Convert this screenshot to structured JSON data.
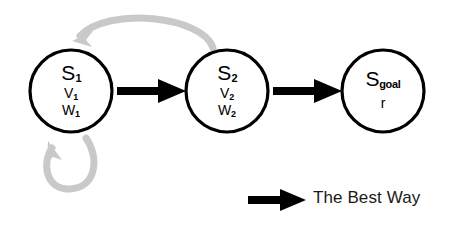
{
  "diagram": {
    "title_visible": false,
    "background_color": "#ffffff",
    "node_stroke_color": "#000000",
    "best_way_color": "#000000",
    "alternate_path_color": "#c9c9c9",
    "nodes": [
      {
        "id": "s1",
        "symbol": "S",
        "symbol_subscript": "1",
        "lines": [
          {
            "text": "V",
            "subscript": "1"
          },
          {
            "text": "W",
            "subscript": "1"
          }
        ],
        "cx": 71,
        "cy": 91,
        "r": 41
      },
      {
        "id": "s2",
        "symbol": "S",
        "symbol_subscript": "2",
        "lines": [
          {
            "text": "V",
            "subscript": "2"
          },
          {
            "text": "W",
            "subscript": "2"
          }
        ],
        "cx": 227,
        "cy": 91,
        "r": 41
      },
      {
        "id": "sgoal",
        "symbol": "S",
        "symbol_subscript": "goal",
        "lines": [
          {
            "text": "r",
            "subscript": ""
          }
        ],
        "cx": 383,
        "cy": 91,
        "r": 41
      }
    ],
    "edges": [
      {
        "id": "s1-to-s2",
        "style": "thick-black-arrow",
        "from": "s1",
        "to": "s2"
      },
      {
        "id": "s2-to-sgoal",
        "style": "thick-black-arrow",
        "from": "s2",
        "to": "sgoal"
      },
      {
        "id": "s2-back-to-s1",
        "style": "gray-curved-arrow",
        "from": "s2",
        "to": "s1"
      },
      {
        "id": "s1-self-loop",
        "style": "gray-curved-arrow",
        "from": "s1",
        "to": "s1"
      }
    ]
  },
  "legend": {
    "label": "The Best Way",
    "arrow_style": "thick-black-arrow"
  }
}
